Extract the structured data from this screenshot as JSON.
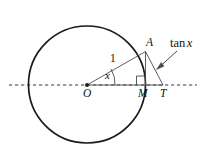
{
  "figure": {
    "background_color": "#ffffff",
    "stroke_color": "#1a1a1a",
    "labels": {
      "point_A": "A",
      "point_O": "O",
      "point_M": "M",
      "point_T": "T",
      "radius_length": "1",
      "angle": "x",
      "tangent_fn": "tan",
      "tangent_arg": "x"
    },
    "geometry": {
      "circle": {
        "cx": 87,
        "cy": 84.5,
        "r": 58.5
      },
      "center_O": {
        "x": 87,
        "y": 85
      },
      "point_A": {
        "x": 145.5,
        "y": 51.5
      },
      "point_M": {
        "x": 145.5,
        "y": 85
      },
      "point_T": {
        "x": 163,
        "y": 85
      },
      "axis_line": {
        "x1": 9,
        "x2": 197,
        "y": 85,
        "style": "dashed"
      },
      "angle_arc_radius": 28,
      "right_angle_marker_size": 9,
      "annotation_arrow": {
        "from_x": 177,
        "from_y": 51,
        "to_x": 157,
        "to_y": 69
      }
    }
  }
}
